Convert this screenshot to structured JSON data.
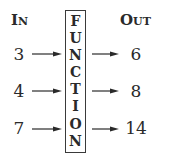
{
  "headers": {
    "input": {
      "first": "I",
      "rest": "N"
    },
    "output": {
      "first": "O",
      "rest": "UT"
    }
  },
  "box": {
    "letters": [
      "F",
      "U",
      "N",
      "C",
      "T",
      "I",
      "O",
      "N"
    ]
  },
  "rows": [
    {
      "input": "3",
      "output": "6"
    },
    {
      "input": "4",
      "output": "8"
    },
    {
      "input": "7",
      "output": "14"
    }
  ],
  "colors": {
    "ink": "#2a2a2a",
    "border": "#3a3a3a",
    "background": "#ffffff"
  }
}
